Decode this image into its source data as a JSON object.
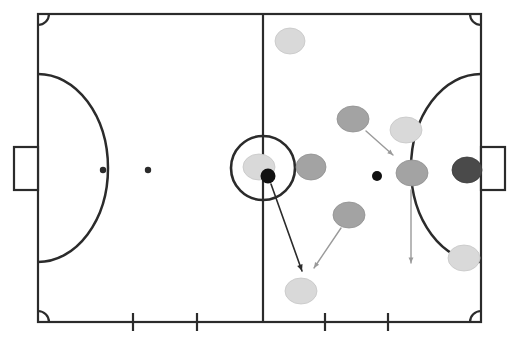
{
  "diagram": {
    "sport": "futsal",
    "view": "full-court-top-down",
    "background_color": "#ffffff",
    "line_color": "#2b2b2b"
  },
  "pitch": {
    "name": "futsal-court",
    "outline": {
      "x": 38,
      "y": 14,
      "width": 443,
      "height": 308
    },
    "line_width": 2.2,
    "halfway_line": {
      "x": 263,
      "y1": 14,
      "y2": 322
    },
    "center_circle": {
      "cx": 263,
      "cy": 168,
      "r": 32
    },
    "center_mark": {
      "cx": 263,
      "cy": 168,
      "r": 0
    },
    "corner_arc_radius": 11,
    "penalty_areas": [
      {
        "side": "left",
        "arc_cx": 38,
        "arc_cy": 168,
        "arc_rx": 70,
        "arc_ry": 94
      },
      {
        "side": "right",
        "arc_cx": 481,
        "arc_cy": 168,
        "arc_rx": 70,
        "arc_ry": 94
      }
    ],
    "penalty_spots": [
      {
        "name": "left-penalty-spot",
        "cx": 103,
        "cy": 170,
        "r": 3.2
      },
      {
        "name": "left-second-spot",
        "cx": 148,
        "cy": 170,
        "r": 3.2
      }
    ],
    "goals": [
      {
        "side": "left",
        "x": 14,
        "y": 147,
        "width": 24,
        "height": 43
      },
      {
        "side": "right",
        "x": 481,
        "y": 147,
        "width": 24,
        "height": 43
      }
    ],
    "substitution_marks": [
      {
        "name": "sub-mark-1",
        "x": 133,
        "y_top": 313,
        "y_bottom": 331
      },
      {
        "name": "sub-mark-2",
        "x": 197,
        "y_top": 313,
        "y_bottom": 331
      },
      {
        "name": "sub-mark-3",
        "x": 325,
        "y_top": 313,
        "y_bottom": 331
      },
      {
        "name": "sub-mark-4",
        "x": 388,
        "y_top": 313,
        "y_bottom": 331
      }
    ]
  },
  "colors": {
    "team_light": "#d9d9d9",
    "team_light_stroke": "#c6c6c6",
    "team_medium": "#a3a3a3",
    "team_medium_stroke": "#909090",
    "goalkeeper": "#4a4a4a",
    "goalkeeper_stroke": "#3c3c3c",
    "ball": "#111111",
    "pass_arrow": "#2b2b2b",
    "run_arrow": "#9a9a9a",
    "line": "#2b2b2b"
  },
  "players": [
    {
      "id": "L1",
      "label": "",
      "team": "light",
      "role": "attacker",
      "cx": 290,
      "cy": 41,
      "rx": 15,
      "ry": 13,
      "color": "#d9d9d9"
    },
    {
      "id": "M1",
      "label": "",
      "team": "medium",
      "role": "defender",
      "cx": 353,
      "cy": 119,
      "rx": 16,
      "ry": 13,
      "color": "#a3a3a3"
    },
    {
      "id": "L2",
      "label": "",
      "team": "light",
      "role": "attacker",
      "cx": 406,
      "cy": 130,
      "rx": 16,
      "ry": 13,
      "color": "#d9d9d9"
    },
    {
      "id": "L3",
      "label": "",
      "team": "light",
      "role": "ball-carrier",
      "cx": 259,
      "cy": 167,
      "rx": 16,
      "ry": 13,
      "color": "#d9d9d9"
    },
    {
      "id": "M2",
      "label": "",
      "team": "medium",
      "role": "defender",
      "cx": 311,
      "cy": 167,
      "rx": 15,
      "ry": 13,
      "color": "#a3a3a3"
    },
    {
      "id": "M3",
      "label": "",
      "team": "medium",
      "role": "defender",
      "cx": 412,
      "cy": 173,
      "rx": 16,
      "ry": 13,
      "color": "#a3a3a3"
    },
    {
      "id": "GK",
      "label": "",
      "team": "goalkeeper",
      "role": "goalkeeper",
      "cx": 467,
      "cy": 170,
      "rx": 15,
      "ry": 13,
      "color": "#4a4a4a"
    },
    {
      "id": "M4",
      "label": "",
      "team": "medium",
      "role": "defender",
      "cx": 349,
      "cy": 215,
      "rx": 16,
      "ry": 13,
      "color": "#a3a3a3"
    },
    {
      "id": "L4",
      "label": "",
      "team": "light",
      "role": "attacker",
      "cx": 464,
      "cy": 258,
      "rx": 16,
      "ry": 13,
      "color": "#d9d9d9"
    },
    {
      "id": "L5",
      "label": "",
      "team": "light",
      "role": "attacker",
      "cx": 301,
      "cy": 291,
      "rx": 16,
      "ry": 13,
      "color": "#d9d9d9"
    }
  ],
  "balls": [
    {
      "id": "ball-1",
      "cx": 268,
      "cy": 176,
      "r": 7.5,
      "color": "#111111"
    },
    {
      "id": "ball-2",
      "cx": 377,
      "cy": 176,
      "r": 5.0,
      "color": "#111111"
    }
  ],
  "arrows": [
    {
      "id": "pass-arrow",
      "kind": "pass",
      "color": "#2b2b2b",
      "width": 1.6,
      "x1": 271,
      "y1": 184,
      "x2": 302,
      "y2": 271,
      "head_size": 7
    },
    {
      "id": "run-arrow-diagonal",
      "kind": "run",
      "color": "#9a9a9a",
      "width": 1.4,
      "x1": 341,
      "y1": 228,
      "x2": 314,
      "y2": 268,
      "head_size": 6
    },
    {
      "id": "run-arrow-defender",
      "kind": "run",
      "color": "#9a9a9a",
      "width": 1.4,
      "x1": 366,
      "y1": 131,
      "x2": 393,
      "y2": 155,
      "head_size": 6
    },
    {
      "id": "run-arrow-vertical",
      "kind": "run",
      "color": "#9a9a9a",
      "width": 1.4,
      "x1": 411,
      "y1": 190,
      "x2": 411,
      "y2": 263,
      "head_size": 6
    }
  ]
}
